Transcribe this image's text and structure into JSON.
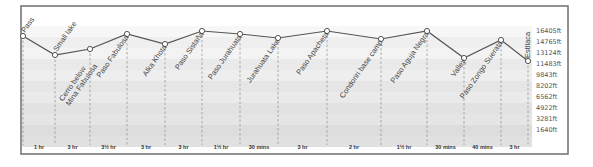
{
  "chart_data": {
    "type": "line",
    "title": "",
    "xlabel": "",
    "ylabel": "Elevation (ft)",
    "y_tick_labels": [
      "16405ft",
      "14765ft",
      "13124ft",
      "11483ft",
      "9843ft",
      "8202ft",
      "6562ft",
      "4922ft",
      "3281ft",
      "1640ft"
    ],
    "grid": "horizontal alternating bands",
    "points": [
      {
        "label": "Pass",
        "x": 23,
        "y": 36
      },
      {
        "label": "Small lake",
        "x": 55,
        "y": 55
      },
      {
        "label": "Cerro below Mina Fabulosa",
        "x": 90,
        "y": 49
      },
      {
        "label": "Paso Fabulosa",
        "x": 127,
        "y": 34
      },
      {
        "label": "Alka Khota",
        "x": 165,
        "y": 44
      },
      {
        "label": "Paso Sistaña",
        "x": 202,
        "y": 31
      },
      {
        "label": "Paso Jurahuata",
        "x": 240,
        "y": 34
      },
      {
        "label": "Jurahuata Lake",
        "x": 278,
        "y": 38
      },
      {
        "label": "Paso Apacheta",
        "x": 327,
        "y": 31
      },
      {
        "label": "Condoriri base camp",
        "x": 381,
        "y": 39
      },
      {
        "label": "Paso Aguja Negra",
        "x": 427,
        "y": 31
      },
      {
        "label": "Valley",
        "x": 464,
        "y": 58
      },
      {
        "label": "Paso Zongo Suerata",
        "x": 501,
        "y": 40
      },
      {
        "label": "Estllaca",
        "x": 528,
        "y": 61
      }
    ],
    "segment_durations": [
      "1 hr",
      "3 hr",
      "3½ hr",
      "3 hr",
      "3 hr",
      "1½ hr",
      "30 mins",
      "3 hr",
      "2 hr",
      "1½ hr",
      "30 mins",
      "40 mins",
      "3 hr"
    ],
    "series": [
      {
        "name": "Elevation profile",
        "values": [
          15700,
          14600,
          15000,
          15900,
          15300,
          16200,
          15950,
          15700,
          16200,
          15750,
          16200,
          14400,
          15650,
          14300
        ]
      }
    ]
  }
}
